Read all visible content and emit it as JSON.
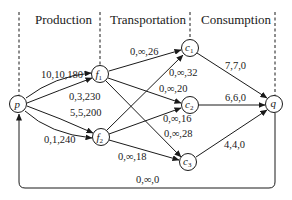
{
  "headers": {
    "production": "Production",
    "transportation": "Transportation",
    "consumption": "Consumption"
  },
  "nodes": {
    "p": {
      "label": "p",
      "sub": ""
    },
    "f1": {
      "label": "f",
      "sub": "1"
    },
    "f2": {
      "label": "f",
      "sub": "2"
    },
    "c1": {
      "label": "c",
      "sub": "1"
    },
    "c2": {
      "label": "c",
      "sub": "2"
    },
    "c3": {
      "label": "c",
      "sub": "3"
    },
    "q": {
      "label": "q",
      "sub": ""
    }
  },
  "edges": {
    "p_f1_a": "10,10,180",
    "p_f1_b": "0,3,230",
    "p_f2_a": "5,5,200",
    "p_f2_b": "0,1,240",
    "f1_c1": "0,∞,26",
    "f1_c2": "0,∞,20",
    "f1_c3": "0,∞,28",
    "f2_c1": "0,∞,32",
    "f2_c2": "0,∞,16",
    "f2_c3": "0,∞,18",
    "c1_q": "7,7,0",
    "c2_q": "6,6,0",
    "c3_q": "4,4,0",
    "q_p": "0,∞,0"
  },
  "colors": {
    "ink": "#1a1a1a",
    "background": "#ffffff"
  }
}
